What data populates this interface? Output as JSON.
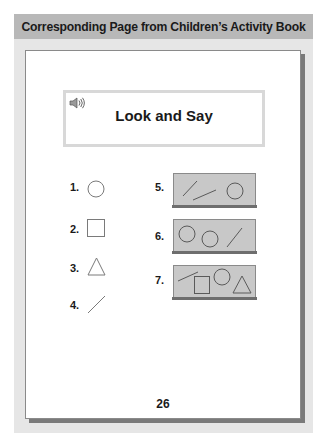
{
  "header": {
    "title": "Corresponding Page from Children’s Activity Book"
  },
  "page": {
    "title": "Look and Say",
    "audio_icon": "speaker-icon",
    "page_number": "26",
    "items": [
      {
        "label": "1.",
        "shapes": [
          "circle"
        ]
      },
      {
        "label": "2.",
        "shapes": [
          "square"
        ]
      },
      {
        "label": "3.",
        "shapes": [
          "triangle"
        ]
      },
      {
        "label": "4.",
        "shapes": [
          "line"
        ]
      },
      {
        "label": "5.",
        "shapes": [
          "line",
          "line",
          "circle"
        ]
      },
      {
        "label": "6.",
        "shapes": [
          "circle",
          "circle",
          "line"
        ]
      },
      {
        "label": "7.",
        "shapes": [
          "line",
          "square",
          "circle",
          "triangle"
        ]
      }
    ]
  },
  "colors": {
    "header_bg": "#b8b8b8",
    "panel_bg": "#e6e6e6",
    "scene_bg": "#c8c8c8",
    "stroke": "#5a5a5a"
  }
}
